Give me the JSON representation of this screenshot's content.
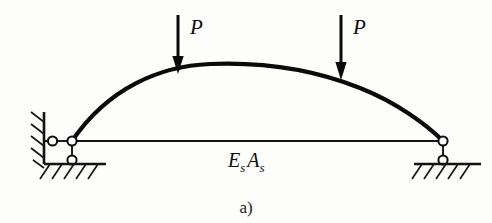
{
  "figure": {
    "caption": "a)",
    "background_color": "#fdfdfb",
    "line_color": "#0a0a0a"
  },
  "labels": {
    "load_left": "P",
    "load_right": "P",
    "tie_symbol_main": "E",
    "tie_symbol_main_sub": "s",
    "tie_symbol_second": "A",
    "tie_symbol_second_sub": "s"
  },
  "geometry": {
    "arch": {
      "left_springing": [
        72,
        141
      ],
      "apex": [
        265,
        64
      ],
      "right_springing": [
        443,
        141
      ]
    },
    "tie_rod": {
      "start": [
        72,
        141
      ],
      "end": [
        443,
        141
      ]
    },
    "loads": [
      {
        "name": "left-load",
        "x": 178,
        "tail_y": 15,
        "tip_y": 73
      },
      {
        "name": "right-load",
        "x": 341,
        "tail_y": 15,
        "tip_y": 79
      }
    ],
    "supports": {
      "left": {
        "type": "pin-on-wall-with-roller",
        "wall_x": 44,
        "wall_top": 112,
        "wall_bottom": 163,
        "pin_at_wall": [
          52,
          141
        ],
        "node": [
          72,
          141
        ],
        "roller": [
          72,
          160
        ],
        "ground_y": 163,
        "ground_from": 44,
        "ground_to": 106
      },
      "right": {
        "type": "pin-with-roller",
        "node": [
          443,
          141
        ],
        "roller": [
          443,
          160
        ],
        "ground_y": 163,
        "ground_from": 415,
        "ground_to": 481
      }
    }
  }
}
